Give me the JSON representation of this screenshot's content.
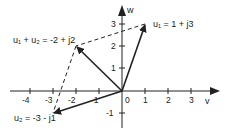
{
  "diagram": {
    "axes": {
      "horizontal_label": "v",
      "vertical_label": "w",
      "origin_label": "0"
    },
    "x_ticks": [
      "-4",
      "-3",
      "-2",
      "-1",
      "1",
      "2",
      "3"
    ],
    "y_ticks": [
      "3",
      "2",
      "1",
      "-1"
    ],
    "vectors": [
      {
        "name": "u1",
        "label": "u₁ = 1 + j3",
        "v": 1,
        "w": 3
      },
      {
        "name": "u2",
        "label": "u₂ = -3 - j1",
        "v": -3,
        "w": -1
      },
      {
        "name": "sum",
        "label": "u₁ + u₂ = -2 + j2",
        "v": -2,
        "w": 2
      }
    ],
    "colors": {
      "ink": "#222222",
      "background": "#ffffff"
    }
  }
}
